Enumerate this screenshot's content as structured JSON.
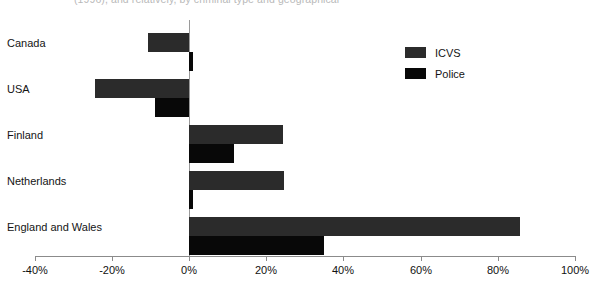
{
  "caption": {
    "text": "(1996), and relatively, by criminal type and geographical"
  },
  "legend": {
    "position": "top-right",
    "items": [
      {
        "label": "ICVS",
        "color": "#2b2b2b",
        "swatch": "legend-swatch-icvs"
      },
      {
        "label": "Police",
        "color": "#080808",
        "swatch": "legend-swatch-police"
      }
    ]
  },
  "axis": {
    "ticks": [
      {
        "label": "-40%",
        "value": -40
      },
      {
        "label": "-20%",
        "value": -20
      },
      {
        "label": "0%",
        "value": 0
      },
      {
        "label": "20%",
        "value": 20
      },
      {
        "label": "40%",
        "value": 40
      },
      {
        "label": "60%",
        "value": 60
      },
      {
        "label": "80%",
        "value": 80
      },
      {
        "label": "100%",
        "value": 100
      }
    ]
  },
  "chart_data": {
    "type": "bar",
    "orientation": "horizontal",
    "title": "",
    "xlabel": "",
    "ylabel": "",
    "xlim": [
      -40,
      100
    ],
    "grid": false,
    "legend_position": "top-right",
    "categories": [
      "Canada",
      "USA",
      "Finland",
      "Netherlands",
      "England and Wales"
    ],
    "series": [
      {
        "name": "ICVS",
        "color": "#2b2b2b",
        "values": [
          -10.6,
          -24.3,
          24.3,
          24.5,
          85.8
        ]
      },
      {
        "name": "Police",
        "color": "#080808",
        "values": [
          1.0,
          -8.8,
          11.6,
          1.0,
          34.9
        ]
      }
    ]
  }
}
